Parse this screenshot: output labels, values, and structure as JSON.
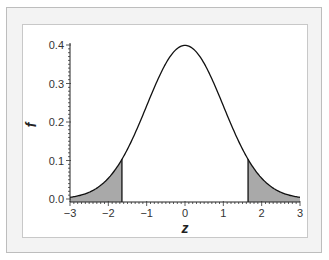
{
  "chart_data": {
    "type": "area",
    "title": "",
    "xlabel": "z",
    "ylabel": "f",
    "xlim": [
      -3,
      3
    ],
    "ylim": [
      0.0,
      0.4
    ],
    "x_ticks": [
      -3,
      -2,
      -1,
      0,
      1,
      2,
      3
    ],
    "x_tick_labels": [
      "−3",
      "−2",
      "−1",
      "0",
      "1",
      "2",
      "3"
    ],
    "y_ticks": [
      0.0,
      0.1,
      0.2,
      0.3,
      0.4
    ],
    "y_tick_labels": [
      "0.0",
      "0.1",
      "0.2",
      "0.3",
      "0.4"
    ],
    "grid": false,
    "legend": null,
    "series": [
      {
        "name": "standard normal density",
        "function": "f(z) = exp(-z^2/2)/sqrt(2*pi)",
        "x": [
          -3,
          -2.5,
          -2,
          -1.645,
          -1.5,
          -1,
          -0.5,
          0,
          0.5,
          1,
          1.5,
          1.645,
          2,
          2.5,
          3
        ],
        "values": [
          0.004,
          0.018,
          0.054,
          0.103,
          0.13,
          0.242,
          0.352,
          0.399,
          0.352,
          0.242,
          0.13,
          0.103,
          0.054,
          0.018,
          0.004
        ]
      }
    ],
    "shaded_regions": [
      {
        "name": "left tail",
        "from": -3,
        "to": -1.645,
        "color": "#a9a9a9"
      },
      {
        "name": "right tail",
        "from": 1.645,
        "to": 3,
        "color": "#a9a9a9"
      }
    ]
  },
  "colors": {
    "frame_bg": "#f3f3f3",
    "panel_bg": "#ffffff",
    "curve": "#111111",
    "shade": "#a9a9a9"
  }
}
